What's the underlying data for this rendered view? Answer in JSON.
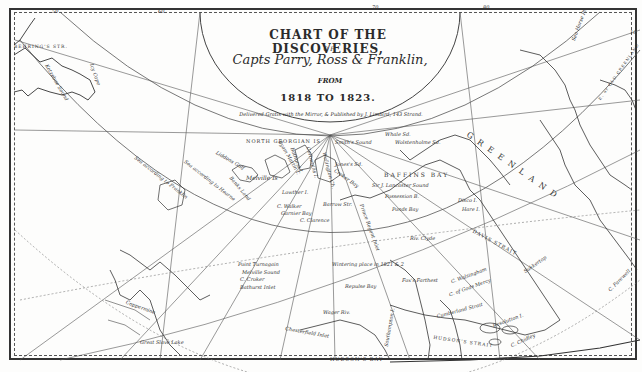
{
  "title": {
    "main": "CHART OF THE DISCOVERIES,",
    "of": "OF",
    "names": "Capts Parry, Ross & Franklin,",
    "from": "FROM",
    "dates": "1818  TO  1823.",
    "publisher": "Delivered Gratis with the Mirror, & Published by J. Limbird, 143 Strand."
  },
  "labels": {
    "behrings_str": "BEHRING'S STR.",
    "kotzebue_sound": "Kotzebue Sound",
    "icy_cape": "Icy Cape",
    "sea_franklin_1": "Sea according to Franklin",
    "sea_franklin_2": "Sea according to Hearne",
    "north_georgian": "NORTH GEORGIAN IS",
    "melville_is": "Melville Is",
    "banks_land": "Banks Land",
    "liddons_gulf": "Liddons Gulf",
    "byam_martin": "Byam Martin I.",
    "bathurst_i": "Bathurst I.",
    "cornwallis_i": "Cornwallis I.",
    "wellington": "Wellington Ch.",
    "griffith": "Griffith I.",
    "lowther": "Lowther I.",
    "c_walker": "C. Walker",
    "garnier_bay": "Garnier Bay",
    "c_clarence": "C. Clarence",
    "barrow_str": "Barrow Str.",
    "smiths_sound": "Smith's Sound",
    "jones_sd": "Jones's Sd.",
    "croker_bay": "Croker Bay",
    "baffins_bay": "BAFFINS BAY",
    "whale_sd": "Whale Sd.",
    "wolstenholme": "Wolstenholme Sd.",
    "prince_regent": "Prince Regent Inlet",
    "sir_lancaster": "Sir J. Lancaster Sound",
    "possession": "Possession B.",
    "pond_bay": "Ponds Bay",
    "river_clyde": "Riv. Clyde",
    "greenland": "G R E E N L A N D",
    "disco": "Disco I.",
    "hare_i": "Hare I.",
    "davis_strait": "DAVIS STRAIT",
    "sukkertop": "Sukkertop",
    "c_farewell": "C. Farewell",
    "point_turnagain": "Point Turnagain",
    "melville_sound": "Melville Sound",
    "c_croker": "C. Croker",
    "bathurst_inlet": "Bathurst Inlet",
    "wintering_place": "Wintering place in 1821 & 2",
    "repulse_bay": "Repulse Bay",
    "wager_riv": "Wager Riv.",
    "southampton": "Southampton I.",
    "chesterfield": "Chesterfield Inlet",
    "hudsons_bay": "HUDSON'S BAY",
    "fox_farthest": "Fox's Farthest",
    "c_walsingham": "C. Walsingham",
    "cumberland_strait": "Cumberland Strait",
    "c_of_gods_mercy": "C. of Gods Mercy",
    "resolution": "Resolution I.",
    "hudsons_strait": "HUDSON'S STRAIT",
    "c_chidley": "C. Chidley",
    "great_slave_lake": "Great Slave Lake",
    "coppermine": "Coppermine",
    "east_greenland": "E. or OLD GREENLAND",
    "sea_horse": "Sea Horse Pt."
  },
  "graticule": {
    "top_ticks": [
      "50",
      "60",
      "70",
      "80",
      "10"
    ],
    "lat_labels": [
      "70",
      "60"
    ]
  },
  "colors": {
    "ink": "#333333",
    "paper": "#fdfdfc",
    "border": "#333333"
  }
}
